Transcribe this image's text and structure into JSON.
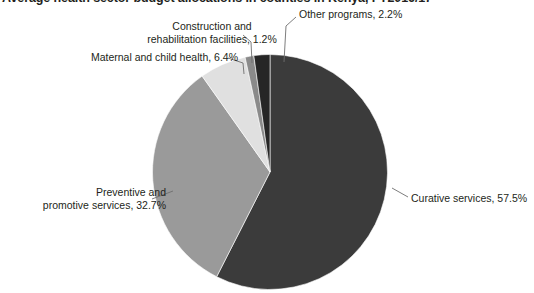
{
  "chart_data": {
    "type": "pie",
    "title": "Average health sector budget allocations in counties in Kenya, FY2016/17",
    "xlabel": "",
    "ylabel": "",
    "legend_position": "none",
    "grid": false,
    "labels": [
      "Curative services",
      "Preventive and promotive services",
      "Maternal and child health",
      "Construction and rehabilitation facilities",
      "Other programs"
    ],
    "values": [
      57.5,
      32.7,
      6.4,
      1.2,
      2.2
    ],
    "value_suffix": "%",
    "colors": [
      "#3b3b3b",
      "#9a9a9a",
      "#e0e0e0",
      "#8a8a8a",
      "#262626"
    ],
    "start_angle_deg": 0,
    "direction": "clockwise",
    "annotations": [
      "Curative services, 57.5%",
      "Preventive and promotive services, 32.7%",
      "Maternal and child health, 6.4%",
      "Construction and rehabilitation facilities, 1.2%",
      "Other programs, 2.2%"
    ]
  },
  "labels": {
    "curative": "Curative services, 57.5%",
    "preventive": "Preventive and\npromotive services, 32.7%",
    "maternal": "Maternal and child health, 6.4%",
    "construction": "Construction and\nrehabilitation facilities, 1.2%",
    "other": "Other programs, 2.2%"
  }
}
